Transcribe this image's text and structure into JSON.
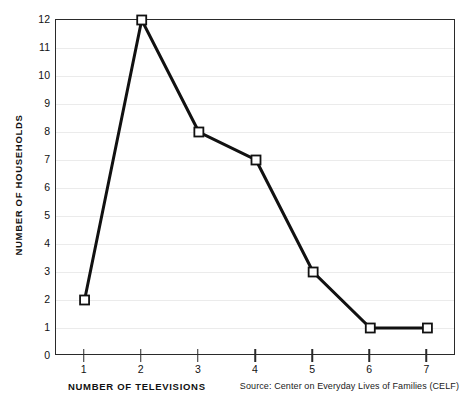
{
  "chart_data": {
    "type": "line",
    "title": "",
    "subtitle": "",
    "xlabel": "NUMBER OF TELEVISIONS",
    "ylabel": "NUMBER OF HOUSEHOLDS",
    "x": [
      1,
      2,
      3,
      4,
      5,
      6,
      7
    ],
    "values": [
      2,
      12,
      8,
      7,
      3,
      1,
      1
    ],
    "series": [
      {
        "name": "Number of households",
        "values": [
          2,
          12,
          8,
          7,
          3,
          1,
          1
        ]
      }
    ],
    "xlim": [
      0.5,
      7.5
    ],
    "ylim": [
      0,
      12
    ],
    "x_tick_labels": [
      "1",
      "2",
      "3",
      "4",
      "5",
      "6",
      "7"
    ],
    "y_tick_labels": [
      "0",
      "1",
      "2",
      "3",
      "4",
      "5",
      "6",
      "7",
      "8",
      "9",
      "10",
      "11",
      "12"
    ],
    "y_ticks": [
      0,
      1,
      2,
      3,
      4,
      5,
      6,
      7,
      8,
      9,
      10,
      11,
      12
    ],
    "grid": "horizontal",
    "legend": "none",
    "annotations": [],
    "source_note": "Source: Center on Everyday Lives of Families (CELF)",
    "line_color": "#111111",
    "marker_fill": "#ffffff",
    "marker_edge": "#111111",
    "grid_color": "#ebebeb",
    "axis_color": "#2a2a2a",
    "background": "#ffffff"
  }
}
